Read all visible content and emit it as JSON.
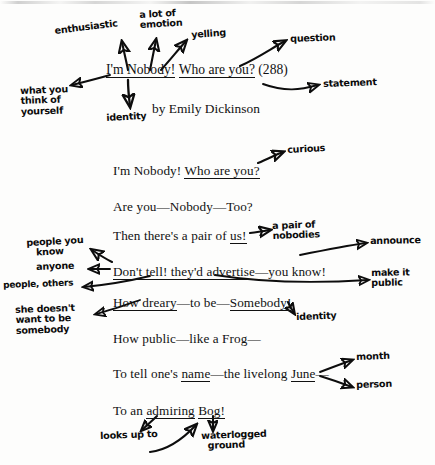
{
  "document": {
    "kind": "annotated-poem-worksheet",
    "title_line": {
      "part1": "I'm Nobody!",
      "part2": "Who are you?",
      "part3": "(288)"
    },
    "byline": "by Emily Dickinson"
  },
  "poem": {
    "lines": [
      {
        "id": "l1",
        "segments": [
          {
            "text": "I'm Nobody! ",
            "underline": false
          },
          {
            "text": "Who are you?",
            "underline": true
          }
        ]
      },
      {
        "id": "l2",
        "segments": [
          {
            "text": "Are you—Nobody—Too?",
            "underline": false
          }
        ]
      },
      {
        "id": "l3",
        "segments": [
          {
            "text": "Then there's a pair of ",
            "underline": false
          },
          {
            "text": "us!",
            "underline": true
          }
        ]
      },
      {
        "id": "l4",
        "segments": [
          {
            "text": "Don't tell! they'd advertise",
            "underline": true
          },
          {
            "text": "—you know!",
            "underline": false
          }
        ]
      },
      {
        "id": "l5",
        "segments": [
          {
            "text": "How dreary",
            "underline": true
          },
          {
            "text": "—to be—",
            "underline": false
          },
          {
            "text": "Somebody!",
            "underline": true
          }
        ]
      },
      {
        "id": "l6",
        "segments": [
          {
            "text": "How public—like a Frog—",
            "underline": false
          }
        ]
      },
      {
        "id": "l7",
        "segments": [
          {
            "text": "To tell one's ",
            "underline": false
          },
          {
            "text": "name",
            "underline": true
          },
          {
            "text": "—the livelong ",
            "underline": false
          },
          {
            "text": "June",
            "underline": true
          },
          {
            "text": "—",
            "underline": false
          }
        ]
      },
      {
        "id": "l8",
        "segments": [
          {
            "text": "To an ",
            "underline": false
          },
          {
            "text": "admiring",
            "underline": true
          },
          {
            "text": " ",
            "underline": false
          },
          {
            "text": "Bog!",
            "underline": true
          }
        ]
      }
    ]
  },
  "annotations": [
    {
      "id": "a-enthusiastic",
      "text": "enthusiastic"
    },
    {
      "id": "a-alotof-emotion",
      "text": "a lot of\nemotion"
    },
    {
      "id": "a-yelling",
      "text": "yelling"
    },
    {
      "id": "a-question",
      "text": "question"
    },
    {
      "id": "a-statement",
      "text": "statement"
    },
    {
      "id": "a-whatyouthink",
      "text": "what you\nthink of\nyourself"
    },
    {
      "id": "a-identity-top",
      "text": "identity"
    },
    {
      "id": "a-curious",
      "text": "curious"
    },
    {
      "id": "a-pairofnobodies",
      "text": "a pair of\nnobodies"
    },
    {
      "id": "a-announce",
      "text": "announce"
    },
    {
      "id": "a-makeitpublic",
      "text": "make it\npublic"
    },
    {
      "id": "a-peopleyouknow",
      "text": "people you\n   know"
    },
    {
      "id": "a-anyone",
      "text": "anyone"
    },
    {
      "id": "a-peopleothers",
      "text": "people, others"
    },
    {
      "id": "a-shedoesnt",
      "text": "she doesn't\nwant to be\nsomebody"
    },
    {
      "id": "a-identity-mid",
      "text": "identity"
    },
    {
      "id": "a-month",
      "text": "month"
    },
    {
      "id": "a-person",
      "text": "person"
    },
    {
      "id": "a-looksupto",
      "text": "looks up to"
    },
    {
      "id": "a-waterlogged",
      "text": "waterlogged\n  ground"
    }
  ],
  "colors": {
    "ink": "#0d0d0d",
    "print": "#111111",
    "paper": "#fdfdfc"
  }
}
